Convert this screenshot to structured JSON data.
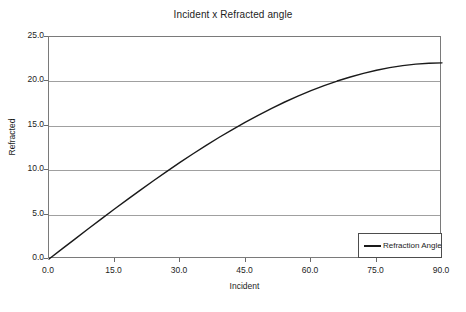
{
  "chart_data": {
    "type": "line",
    "title": "Incident x Refracted angle",
    "xlabel": "Incident",
    "ylabel": "Refracted",
    "xlim": [
      0.0,
      90.0
    ],
    "ylim": [
      0.0,
      25.0
    ],
    "xticks": [
      "0.0",
      "15.0",
      "30.0",
      "45.0",
      "60.0",
      "75.0",
      "90.0"
    ],
    "yticks": [
      "0.0",
      "5.0",
      "10.0",
      "15.0",
      "20.0",
      "25.0"
    ],
    "xtick_values": [
      0,
      15,
      30,
      45,
      60,
      75,
      90
    ],
    "ytick_values": [
      0,
      5,
      10,
      15,
      20,
      25
    ],
    "grid": "horizontal",
    "legend_position": "bottom-right",
    "legend": [
      "Refraction Angle"
    ],
    "series": [
      {
        "name": "Refraction Angle",
        "color": "#1a1a1a",
        "x": [
          0,
          3,
          6,
          9,
          12,
          15,
          18,
          21,
          24,
          27,
          30,
          33,
          36,
          39,
          42,
          45,
          48,
          51,
          54,
          57,
          60,
          63,
          66,
          69,
          72,
          75,
          78,
          81,
          84,
          87,
          90
        ],
        "values": [
          0.0,
          1.14,
          2.27,
          3.4,
          4.52,
          5.63,
          6.72,
          7.79,
          8.84,
          9.87,
          10.88,
          11.85,
          12.8,
          13.71,
          14.58,
          15.42,
          16.21,
          16.97,
          17.68,
          18.34,
          18.96,
          19.53,
          20.04,
          20.5,
          20.91,
          21.26,
          21.55,
          21.78,
          21.95,
          22.05,
          22.09
        ]
      }
    ]
  },
  "legend": {
    "entry_label": "Refraction Angle"
  }
}
